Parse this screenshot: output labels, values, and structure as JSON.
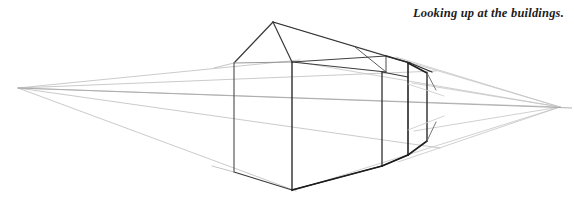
{
  "page": {
    "width": 574,
    "height": 203,
    "background_color": "#ffffff"
  },
  "caption": {
    "text": "Looking up at the buildings.",
    "color": "#1c1c1c",
    "style": "bold-italic"
  },
  "drawing": {
    "type": "line-drawing",
    "description": "Two-point perspective pencil construction of a row of buildings viewed from below, with both vanishing points on a horizon line and light construction lines radiating to them.",
    "colors": {
      "heavy_line": "#2b2b2b",
      "medium_line": "#555555",
      "light_construction_line": "#b8b8b8",
      "very_light_construction_line": "#cfcfcf"
    },
    "vanishing_points": [
      {
        "name": "left-vanishing-point",
        "x": 18,
        "y": 88
      },
      {
        "name": "right-vanishing-point",
        "x": 560,
        "y": 107
      }
    ],
    "horizon": {
      "name": "horizon-line",
      "x1": 18,
      "y1": 88,
      "x2": 560,
      "y2": 107
    },
    "construction_lines": [
      {
        "name": "lvp-to-roof-ridge",
        "x1": 18,
        "y1": 88,
        "x2": 292,
        "y2": 62
      },
      {
        "name": "lvp-to-eave-top",
        "x1": 18,
        "y1": 88,
        "x2": 432,
        "y2": 72
      },
      {
        "name": "lvp-to-bottom-edge",
        "x1": 18,
        "y1": 88,
        "x2": 292,
        "y2": 190
      },
      {
        "name": "lvp-to-far-bottom",
        "x1": 18,
        "y1": 88,
        "x2": 420,
        "y2": 146
      },
      {
        "name": "rvp-to-apex",
        "x1": 560,
        "y1": 107,
        "x2": 273,
        "y2": 22
      },
      {
        "name": "rvp-to-roof-right",
        "x1": 560,
        "y1": 107,
        "x2": 292,
        "y2": 62
      },
      {
        "name": "rvp-to-base-right",
        "x1": 560,
        "y1": 107,
        "x2": 292,
        "y2": 190
      },
      {
        "name": "rvp-to-upper-right",
        "x1": 560,
        "y1": 107,
        "x2": 398,
        "y2": 58
      },
      {
        "name": "rvp-to-lower-right",
        "x1": 560,
        "y1": 107,
        "x2": 404,
        "y2": 160
      },
      {
        "name": "rvp-thin-upper",
        "x1": 560,
        "y1": 107,
        "x2": 408,
        "y2": 84
      },
      {
        "name": "rvp-thin-lower",
        "x1": 560,
        "y1": 107,
        "x2": 410,
        "y2": 132
      }
    ],
    "building_near": {
      "name": "near-building",
      "gable_apex": {
        "x": 273,
        "y": 22
      },
      "left_eave": {
        "x": 234,
        "y": 63
      },
      "right_eave": {
        "x": 292,
        "y": 62
      },
      "front_vertical": {
        "x": 292,
        "y_top": 62,
        "y_bottom": 190
      },
      "left_vertical": {
        "x": 234,
        "y_top": 63,
        "y_bottom": 172
      }
    },
    "building_mid": {
      "name": "mid-building",
      "vertical": {
        "x": 382,
        "y_top": 72,
        "y_bottom": 166
      }
    },
    "building_far": {
      "name": "far-building",
      "vertical_front": {
        "x": 408,
        "y_top": 64,
        "y_bottom": 155
      },
      "vertical_back": {
        "x": 427,
        "y_top": 72,
        "y_bottom": 142
      }
    }
  }
}
